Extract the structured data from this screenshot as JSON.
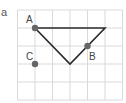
{
  "figure": {
    "panel_label": "a",
    "grid": {
      "columns": 6,
      "rows": 5,
      "color": "#d9d9d9"
    },
    "triangle": {
      "vertices": [
        {
          "col": 1,
          "row": 1
        },
        {
          "col": 5,
          "row": 1
        },
        {
          "col": 3,
          "row": 3
        }
      ],
      "stroke": "#2b2b2b"
    },
    "points": [
      {
        "label": "A",
        "col": 1,
        "row": 1
      },
      {
        "label": "B",
        "col": 4,
        "row": 2
      },
      {
        "label": "C",
        "col": 1,
        "row": 3
      }
    ],
    "point_color": "#666666"
  }
}
